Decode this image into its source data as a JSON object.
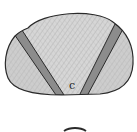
{
  "figure": {
    "labels": {
      "center_region": "c"
    },
    "colors": {
      "outline": "#2a2a2a",
      "fill_light": "#d8d8d8",
      "fill_mid": "#c9c9c9",
      "band": "#8c8c8c",
      "background": "#ffffff"
    }
  }
}
